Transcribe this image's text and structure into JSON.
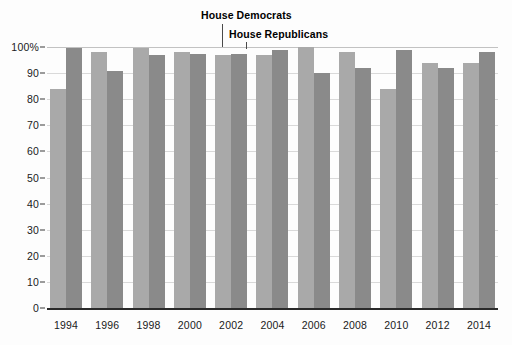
{
  "chart_data": {
    "type": "bar",
    "title": "",
    "subtitle": "",
    "xlabel": "",
    "ylabel": "",
    "categories": [
      "1994",
      "1996",
      "1998",
      "2000",
      "2002",
      "2004",
      "2006",
      "2008",
      "2010",
      "2012",
      "2014"
    ],
    "series": [
      {
        "name": "House Democrats",
        "color": "#a9a9a9",
        "values": [
          84,
          98,
          99.5,
          98,
          97,
          97,
          100,
          98,
          84,
          94,
          94
        ]
      },
      {
        "name": "House Republicans",
        "color": "#8a8a8a",
        "values": [
          99.5,
          91,
          97,
          97.5,
          97.5,
          99,
          90,
          92,
          99,
          92,
          98
        ]
      }
    ],
    "ylim": [
      0,
      100
    ],
    "yticks": [
      "0",
      "10",
      "20",
      "30",
      "40",
      "50",
      "60",
      "70",
      "80",
      "90",
      "100%"
    ],
    "ytick_values": [
      0,
      10,
      20,
      30,
      40,
      50,
      60,
      70,
      80,
      90,
      100
    ],
    "grid": true,
    "legend_position": "inline-annotation",
    "annotations": [
      {
        "text": "House Democrats",
        "points_to_category": "2002",
        "points_to_series": "House Democrats"
      },
      {
        "text": "House Republicans",
        "points_to_category": "2002",
        "points_to_series": "House Republicans"
      }
    ]
  },
  "axes": {
    "y_axis_name": "y-axis",
    "x_axis_name": "x-axis"
  }
}
